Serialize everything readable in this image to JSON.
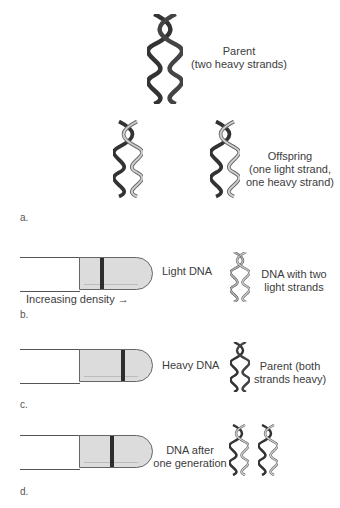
{
  "caption_fragment": "",
  "panel_a": {
    "letter": "a.",
    "parent_label": [
      "Parent",
      "(two heavy strands)"
    ],
    "offspring_label": [
      "Offspring",
      "(one light strand,",
      "one heavy strand)"
    ]
  },
  "panel_b": {
    "letter": "b.",
    "tube_label": "Light DNA",
    "helix_label": [
      "DNA with two",
      "light strands"
    ],
    "axis_label": "Increasing density",
    "axis_arrow": "→"
  },
  "panel_c": {
    "letter": "c.",
    "tube_label": "Heavy DNA",
    "helix_label": [
      "Parent (both",
      "strands heavy)"
    ]
  },
  "panel_d": {
    "letter": "d.",
    "tube_label": [
      "DNA after",
      "one generation"
    ]
  },
  "colors": {
    "heavy_strand": "#333333",
    "light_strand": "#a8a8a8",
    "tube_fill": "#dcdcdc",
    "band": "#2d2d2d"
  }
}
